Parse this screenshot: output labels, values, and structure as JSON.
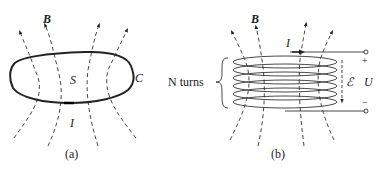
{
  "panel_a": {
    "caption": "(a)",
    "field_label": "B",
    "surface_label": "S",
    "curve_label": "C",
    "current_label": "I"
  },
  "panel_b": {
    "caption": "(b)",
    "field_label": "B",
    "current_label": "I",
    "turns_label": "N turns",
    "emf_label": "ℰ",
    "voltage_label": "U",
    "plus_label": "+",
    "minus_label": "−"
  },
  "colors": {
    "line": "#333333",
    "background": "#ffffff"
  }
}
